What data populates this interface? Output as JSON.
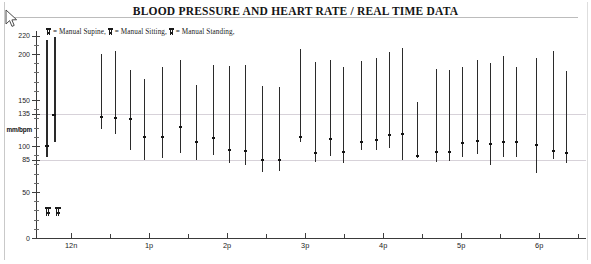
{
  "title": "BLOOD PRESSURE AND HEART RATE / REAL TIME DATA",
  "cursor": {
    "name": "mouse-pointer"
  },
  "legend": {
    "items": [
      {
        "symbol": "manual-supine-glyph",
        "label": "= Manual Supine,"
      },
      {
        "symbol": "manual-sitting-glyph",
        "label": "= Manual Sitting,"
      },
      {
        "symbol": "manual-standing-glyph",
        "label": "= Manual Standing,"
      }
    ],
    "full_text": "= Manual Supine, = Manual Sitting, = Manual Standing,"
  },
  "chart_data": {
    "type": "bar",
    "title": "BLOOD PRESSURE AND HEART RATE / REAL TIME DATA",
    "subtitle": "",
    "xlabel": "",
    "ylabel": "mm/bpm",
    "ylim": [
      0,
      225
    ],
    "xlim": [
      11.55,
      18.6
    ],
    "grid": true,
    "gridlines_y": [
      135,
      85
    ],
    "legend_position": "top-left",
    "y_major_ticks": [
      0,
      50,
      85,
      100,
      135,
      150,
      200,
      220
    ],
    "y_tick_labels": [
      "0",
      "50",
      "85",
      "100",
      "135",
      "150",
      "200",
      "220"
    ],
    "y_minor_tick_step": 10,
    "x_major_ticks": [
      12,
      13,
      14,
      15,
      16,
      17,
      18
    ],
    "x_tick_labels": [
      "12n",
      "1p",
      "2p",
      "3p",
      "4p",
      "5p",
      "6p"
    ],
    "x_minor_ticks": [
      12.5,
      13.5,
      14.5,
      15.5,
      16.5,
      17.5,
      18.5
    ],
    "series": [
      {
        "name": "Systolic-Diastolic range",
        "type": "range-bar"
      },
      {
        "name": "Heart rate",
        "type": "marker"
      }
    ],
    "points": [
      {
        "time": "12n",
        "x": 11.68,
        "systolic": 215,
        "diastolic": 88,
        "hr": 100,
        "thick": true
      },
      {
        "time": "12n",
        "x": 11.78,
        "systolic": 218,
        "diastolic": 104,
        "hr": 134,
        "thick": true
      },
      {
        "time": "12:20p",
        "x": 12.38,
        "systolic": 200,
        "diastolic": 118,
        "hr": 131
      },
      {
        "time": "12:30p",
        "x": 12.56,
        "systolic": 203,
        "diastolic": 113,
        "hr": 130
      },
      {
        "time": "12:40p",
        "x": 12.76,
        "systolic": 183,
        "diastolic": 96,
        "hr": 129
      },
      {
        "time": "12:55p",
        "x": 12.94,
        "systolic": 173,
        "diastolic": 85,
        "hr": 110
      },
      {
        "time": "1:10p",
        "x": 13.17,
        "systolic": 186,
        "diastolic": 87,
        "hr": 110
      },
      {
        "time": "1:25p",
        "x": 13.4,
        "systolic": 193,
        "diastolic": 92,
        "hr": 121
      },
      {
        "time": "1:40p",
        "x": 13.6,
        "systolic": 166,
        "diastolic": 85,
        "hr": 104
      },
      {
        "time": "1:55p",
        "x": 13.82,
        "systolic": 188,
        "diastolic": 90,
        "hr": 109
      },
      {
        "time": "2:10p",
        "x": 14.03,
        "systolic": 187,
        "diastolic": 82,
        "hr": 96
      },
      {
        "time": "2:25p",
        "x": 14.23,
        "systolic": 188,
        "diastolic": 79,
        "hr": 95
      },
      {
        "time": "2:40p",
        "x": 14.45,
        "systolic": 165,
        "diastolic": 72,
        "hr": 85
      },
      {
        "time": "2:55p",
        "x": 14.66,
        "systolic": 164,
        "diastolic": 73,
        "hr": 85
      },
      {
        "time": "3:05p",
        "x": 14.94,
        "systolic": 205,
        "diastolic": 104,
        "hr": 110
      },
      {
        "time": "3:20p",
        "x": 15.13,
        "systolic": 191,
        "diastolic": 83,
        "hr": 92
      },
      {
        "time": "3:35p",
        "x": 15.32,
        "systolic": 193,
        "diastolic": 89,
        "hr": 108
      },
      {
        "time": "3:50p",
        "x": 15.49,
        "systolic": 186,
        "diastolic": 82,
        "hr": 93
      },
      {
        "time": "4:05p",
        "x": 15.71,
        "systolic": 192,
        "diastolic": 96,
        "hr": 104
      },
      {
        "time": "4:20p",
        "x": 15.91,
        "systolic": 196,
        "diastolic": 96,
        "hr": 106
      },
      {
        "time": "4:30p",
        "x": 16.07,
        "systolic": 202,
        "diastolic": 98,
        "hr": 112
      },
      {
        "time": "4:45p",
        "x": 16.24,
        "systolic": 207,
        "diastolic": 85,
        "hr": 113
      },
      {
        "time": "4:55p",
        "x": 16.44,
        "systolic": 148,
        "diastolic": 87,
        "hr": 89
      },
      {
        "time": "5:05p",
        "x": 16.68,
        "systolic": 184,
        "diastolic": 83,
        "hr": 94
      },
      {
        "time": "5:15p",
        "x": 16.84,
        "systolic": 183,
        "diastolic": 84,
        "hr": 93
      },
      {
        "time": "5:25p",
        "x": 17.01,
        "systolic": 186,
        "diastolic": 88,
        "hr": 103
      },
      {
        "time": "5:35p",
        "x": 17.2,
        "systolic": 193,
        "diastolic": 91,
        "hr": 105
      },
      {
        "time": "5:45p",
        "x": 17.37,
        "systolic": 190,
        "diastolic": 79,
        "hr": 102
      },
      {
        "time": "5:55p",
        "x": 17.53,
        "systolic": 198,
        "diastolic": 88,
        "hr": 104
      },
      {
        "time": "6:05p",
        "x": 17.7,
        "systolic": 186,
        "diastolic": 88,
        "hr": 104
      },
      {
        "time": "6:20p",
        "x": 17.96,
        "systolic": 196,
        "diastolic": 71,
        "hr": 101
      },
      {
        "time": "6:30p",
        "x": 18.18,
        "systolic": 203,
        "diastolic": 86,
        "hr": 95
      },
      {
        "time": "6:40p",
        "x": 18.35,
        "systolic": 181,
        "diastolic": 82,
        "hr": 92
      }
    ],
    "posture_markers": [
      {
        "x": 11.7,
        "y": 29,
        "name": "manual-supine-glyph"
      },
      {
        "x": 11.83,
        "y": 29,
        "name": "manual-sitting-glyph"
      }
    ]
  }
}
